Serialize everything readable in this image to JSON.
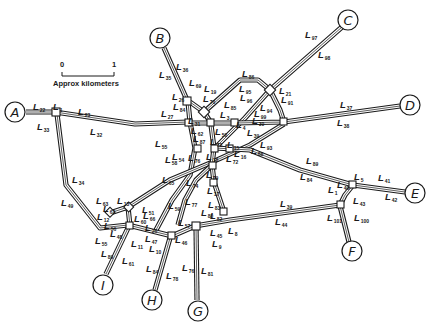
{
  "scale": {
    "start_label": "0",
    "end_label": "1",
    "caption": "Approx kilometers"
  },
  "terminals": [
    {
      "id": "A",
      "label": "A",
      "x": 15,
      "y": 112
    },
    {
      "id": "B",
      "label": "B",
      "x": 160,
      "y": 38
    },
    {
      "id": "C",
      "label": "C",
      "x": 348,
      "y": 20
    },
    {
      "id": "D",
      "label": "D",
      "x": 410,
      "y": 105
    },
    {
      "id": "E",
      "label": "E",
      "x": 415,
      "y": 193
    },
    {
      "id": "F",
      "label": "F",
      "x": 352,
      "y": 251
    },
    {
      "id": "G",
      "label": "G",
      "x": 198,
      "y": 311
    },
    {
      "id": "H",
      "label": "H",
      "x": 152,
      "y": 300
    },
    {
      "id": "I",
      "label": "I",
      "x": 103,
      "y": 285
    }
  ],
  "links": [
    {
      "name": "L",
      "sub": "22",
      "x": 33,
      "y": 110
    },
    {
      "name": "L",
      "sub": "1",
      "x": 53,
      "y": 110
    },
    {
      "name": "L",
      "sub": "33",
      "x": 37,
      "y": 130
    },
    {
      "name": "L",
      "sub": "23",
      "x": 78,
      "y": 115
    },
    {
      "name": "L",
      "sub": "32",
      "x": 90,
      "y": 135
    },
    {
      "name": "L",
      "sub": "34",
      "x": 72,
      "y": 183
    },
    {
      "name": "L",
      "sub": "49",
      "x": 61,
      "y": 206
    },
    {
      "name": "L",
      "sub": "36",
      "x": 176,
      "y": 70
    },
    {
      "name": "L",
      "sub": "35",
      "x": 159,
      "y": 78
    },
    {
      "name": "L",
      "sub": "69",
      "x": 189,
      "y": 86
    },
    {
      "name": "L",
      "sub": "19",
      "x": 204,
      "y": 92
    },
    {
      "name": "L",
      "sub": "26",
      "x": 172,
      "y": 100
    },
    {
      "name": "L",
      "sub": "70",
      "x": 203,
      "y": 102
    },
    {
      "name": "L",
      "sub": "84",
      "x": 173,
      "y": 110
    },
    {
      "name": "L",
      "sub": "27",
      "x": 161,
      "y": 117
    },
    {
      "name": "L",
      "sub": "85",
      "x": 224,
      "y": 108
    },
    {
      "name": "L",
      "sub": "3",
      "x": 220,
      "y": 118
    },
    {
      "name": "L",
      "sub": "86",
      "x": 242,
      "y": 77
    },
    {
      "name": "L",
      "sub": "95",
      "x": 239,
      "y": 92
    },
    {
      "name": "L",
      "sub": "96",
      "x": 240,
      "y": 101
    },
    {
      "name": "L",
      "sub": "21",
      "x": 279,
      "y": 94
    },
    {
      "name": "L",
      "sub": "91",
      "x": 281,
      "y": 103
    },
    {
      "name": "L",
      "sub": "94",
      "x": 260,
      "y": 111
    },
    {
      "name": "L",
      "sub": "99",
      "x": 254,
      "y": 117
    },
    {
      "name": "L",
      "sub": "30",
      "x": 252,
      "y": 124
    },
    {
      "name": "L",
      "sub": "97",
      "x": 305,
      "y": 38
    },
    {
      "name": "L",
      "sub": "98",
      "x": 318,
      "y": 58
    },
    {
      "name": "L",
      "sub": "37",
      "x": 340,
      "y": 108
    },
    {
      "name": "L",
      "sub": "38",
      "x": 337,
      "y": 126
    },
    {
      "name": "L",
      "sub": "31",
      "x": 188,
      "y": 124
    },
    {
      "name": "L",
      "sub": "50",
      "x": 215,
      "y": 135
    },
    {
      "name": "L",
      "sub": "4",
      "x": 236,
      "y": 128
    },
    {
      "name": "L",
      "sub": "39",
      "x": 247,
      "y": 136
    },
    {
      "name": "L",
      "sub": "93",
      "x": 260,
      "y": 148
    },
    {
      "name": "L",
      "sub": "88",
      "x": 251,
      "y": 154
    },
    {
      "name": "L",
      "sub": "62",
      "x": 191,
      "y": 134
    },
    {
      "name": "L",
      "sub": "87",
      "x": 193,
      "y": 142
    },
    {
      "name": "L",
      "sub": "73",
      "x": 210,
      "y": 145
    },
    {
      "name": "L",
      "sub": "15",
      "x": 227,
      "y": 148
    },
    {
      "name": "L",
      "sub": "54",
      "x": 172,
      "y": 160
    },
    {
      "name": "L",
      "sub": "76",
      "x": 188,
      "y": 161
    },
    {
      "name": "L",
      "sub": "55",
      "x": 155,
      "y": 147
    },
    {
      "name": "L",
      "sub": "58",
      "x": 165,
      "y": 163
    },
    {
      "name": "L",
      "sub": "18",
      "x": 206,
      "y": 160
    },
    {
      "name": "L",
      "sub": "72",
      "x": 226,
      "y": 162
    },
    {
      "name": "L",
      "sub": "16",
      "x": 234,
      "y": 157
    },
    {
      "name": "L",
      "sub": "89",
      "x": 306,
      "y": 164
    },
    {
      "name": "L",
      "sub": "84",
      "x": 300,
      "y": 180
    },
    {
      "name": "L",
      "sub": "65",
      "x": 162,
      "y": 183
    },
    {
      "name": "L",
      "sub": "74",
      "x": 186,
      "y": 186
    },
    {
      "name": "L",
      "sub": "79",
      "x": 206,
      "y": 178
    },
    {
      "name": "L",
      "sub": "17",
      "x": 207,
      "y": 194
    },
    {
      "name": "L",
      "sub": "77",
      "x": 185,
      "y": 205
    },
    {
      "name": "L",
      "sub": "83",
      "x": 208,
      "y": 208
    },
    {
      "name": "L",
      "sub": "59",
      "x": 168,
      "y": 209
    },
    {
      "name": "L",
      "sub": "66",
      "x": 143,
      "y": 219
    },
    {
      "name": "L",
      "sub": "80",
      "x": 201,
      "y": 216
    },
    {
      "name": "L",
      "sub": "82",
      "x": 210,
      "y": 219
    },
    {
      "name": "L",
      "sub": "5",
      "x": 354,
      "y": 180
    },
    {
      "name": "L",
      "sub": "41",
      "x": 378,
      "y": 181
    },
    {
      "name": "L",
      "sub": "42",
      "x": 385,
      "y": 200
    },
    {
      "name": "L",
      "sub": "1",
      "x": 328,
      "y": 193
    },
    {
      "name": "L",
      "sub": "40",
      "x": 337,
      "y": 188
    },
    {
      "name": "L",
      "sub": "43",
      "x": 353,
      "y": 204
    },
    {
      "name": "L",
      "sub": "39",
      "x": 280,
      "y": 207
    },
    {
      "name": "L",
      "sub": "44",
      "x": 275,
      "y": 225
    },
    {
      "name": "L",
      "sub": "101",
      "x": 327,
      "y": 221
    },
    {
      "name": "L",
      "sub": "100",
      "x": 354,
      "y": 221
    },
    {
      "name": "L",
      "sub": "63",
      "x": 96,
      "y": 204
    },
    {
      "name": "L",
      "sub": "62",
      "x": 103,
      "y": 212
    },
    {
      "name": "L",
      "sub": "13",
      "x": 117,
      "y": 204
    },
    {
      "name": "L",
      "sub": "12",
      "x": 97,
      "y": 220
    },
    {
      "name": "L",
      "sub": "51",
      "x": 142,
      "y": 213
    },
    {
      "name": "L",
      "sub": "60",
      "x": 134,
      "y": 222
    },
    {
      "name": "L",
      "sub": "56",
      "x": 104,
      "y": 229
    },
    {
      "name": "L",
      "sub": "26",
      "x": 145,
      "y": 231
    },
    {
      "name": "L",
      "sub": "48",
      "x": 110,
      "y": 237
    },
    {
      "name": "L",
      "sub": "55",
      "x": 95,
      "y": 244
    },
    {
      "name": "L",
      "sub": "11",
      "x": 131,
      "y": 247
    },
    {
      "name": "L",
      "sub": "47",
      "x": 145,
      "y": 242
    },
    {
      "name": "L",
      "sub": "10",
      "x": 149,
      "y": 252
    },
    {
      "name": "L",
      "sub": "89",
      "x": 101,
      "y": 257
    },
    {
      "name": "L",
      "sub": "61",
      "x": 122,
      "y": 264
    },
    {
      "name": "L",
      "sub": "84",
      "x": 146,
      "y": 272
    },
    {
      "name": "L",
      "sub": "78",
      "x": 166,
      "y": 279
    },
    {
      "name": "L",
      "sub": "57",
      "x": 178,
      "y": 226
    },
    {
      "name": "L",
      "sub": "45",
      "x": 210,
      "y": 236
    },
    {
      "name": "L",
      "sub": "46",
      "x": 175,
      "y": 243
    },
    {
      "name": "L",
      "sub": "9",
      "x": 212,
      "y": 247
    },
    {
      "name": "L",
      "sub": "8",
      "x": 228,
      "y": 234
    },
    {
      "name": "L",
      "sub": "76",
      "x": 182,
      "y": 271
    },
    {
      "name": "L",
      "sub": "81",
      "x": 201,
      "y": 274
    }
  ]
}
